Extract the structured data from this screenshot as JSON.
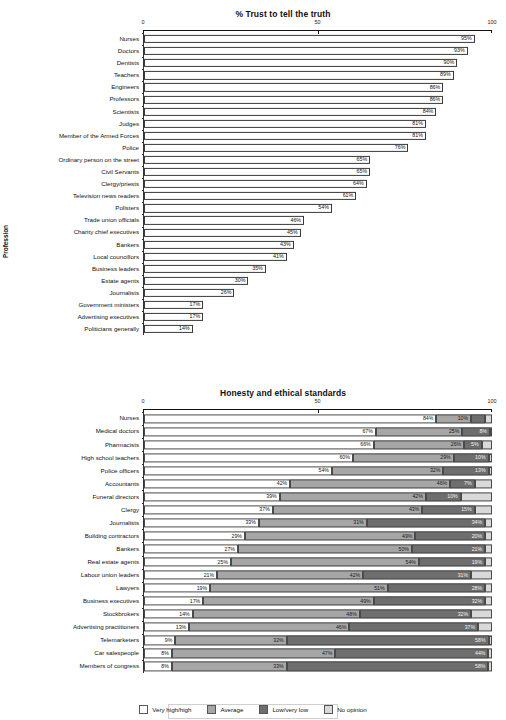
{
  "chart_data": [
    {
      "type": "bar",
      "title": "% Trust to tell the truth",
      "orientation": "horizontal",
      "xlabel": "",
      "ylabel": "Profession",
      "xlim": [
        0,
        100
      ],
      "xticks": [
        "0",
        "50",
        "100"
      ],
      "grid": false,
      "value_suffix": "%",
      "categories": [
        "Nurses",
        "Doctors",
        "Dentists",
        "Teachers",
        "Engineers",
        "Professors",
        "Scientists",
        "Judges",
        "Member of the Armed Forces",
        "Police",
        "Ordinary person on the street",
        "Civil Servants",
        "Clergy/priests",
        "Television news readers",
        "Pollsters",
        "Trade union officials",
        "Charity chief executives",
        "Bankers",
        "Local councillors",
        "Business leaders",
        "Estate agents",
        "Journalists",
        "Government ministers",
        "Advertising executives",
        "Politicians generally"
      ],
      "values": [
        95,
        93,
        90,
        89,
        86,
        86,
        84,
        81,
        81,
        76,
        65,
        65,
        64,
        61,
        54,
        46,
        45,
        43,
        41,
        35,
        30,
        26,
        17,
        17,
        14
      ],
      "labels": [
        "95%",
        "93%",
        "90%",
        "89%",
        "86%",
        "86%",
        "84%",
        "81%",
        "81%",
        "76%",
        "65%",
        "65%",
        "64%",
        "61%",
        "54%",
        "46%",
        "45%",
        "43%",
        "41%",
        "35%",
        "30%",
        "26%",
        "17%",
        "17%",
        "14%"
      ]
    },
    {
      "type": "bar",
      "subtype": "stacked-100",
      "title": "Honesty and ethical standards",
      "orientation": "horizontal",
      "xlabel": "",
      "ylabel": "Profession",
      "xlim": [
        0,
        100
      ],
      "xticks": [
        "0",
        "50",
        "100"
      ],
      "grid": false,
      "legend_position": "bottom",
      "series": [
        {
          "name": "Very high/high",
          "color": "#ffffff"
        },
        {
          "name": "Average",
          "color": "#a6a6a6"
        },
        {
          "name": "Low/very low",
          "color": "#6e6e6e"
        },
        {
          "name": "No opinion",
          "color": "#d9d9d9"
        }
      ],
      "categories": [
        "Nurses",
        "Medical doctors",
        "Pharmacists",
        "High school teachers",
        "Police officers",
        "Accountants",
        "Funeral directors",
        "Clergy",
        "Journalists",
        "Building contractors",
        "Bankers",
        "Real estate agents",
        "Labour union leaders",
        "Lawyers",
        "Business executives",
        "Stockbrokers",
        "Advertising practitioners",
        "Telemarketers",
        "Car salespeople",
        "Members of congress"
      ],
      "rows": [
        {
          "category": "Nurses",
          "values": [
            84,
            10,
            4,
            2
          ],
          "labels": [
            "84%",
            "10%",
            "",
            ""
          ]
        },
        {
          "category": "Medical doctors",
          "values": [
            67,
            25,
            8,
            0
          ],
          "labels": [
            "67%",
            "25%",
            "8%",
            ""
          ]
        },
        {
          "category": "Pharmacists",
          "values": [
            66,
            26,
            5,
            3
          ],
          "labels": [
            "66%",
            "26%",
            "5%",
            ""
          ]
        },
        {
          "category": "High school teachers",
          "values": [
            60,
            29,
            10,
            1
          ],
          "labels": [
            "60%",
            "29%",
            "10%",
            ""
          ]
        },
        {
          "category": "Police officers",
          "values": [
            54,
            32,
            13,
            1
          ],
          "labels": [
            "54%",
            "32%",
            "13%",
            ""
          ]
        },
        {
          "category": "Accountants",
          "values": [
            42,
            46,
            7,
            5
          ],
          "labels": [
            "42%",
            "46%",
            "7%",
            ""
          ]
        },
        {
          "category": "Funeral directors",
          "values": [
            39,
            42,
            10,
            9
          ],
          "labels": [
            "39%",
            "42%",
            "10%",
            ""
          ]
        },
        {
          "category": "Clergy",
          "values": [
            37,
            43,
            15,
            5
          ],
          "labels": [
            "37%",
            "43%",
            "15%",
            ""
          ]
        },
        {
          "category": "Journalists",
          "values": [
            33,
            31,
            34,
            2
          ],
          "labels": [
            "33%",
            "31%",
            "34%",
            ""
          ]
        },
        {
          "category": "Building contractors",
          "values": [
            29,
            49,
            20,
            2
          ],
          "labels": [
            "29%",
            "49%",
            "20%",
            ""
          ]
        },
        {
          "category": "Bankers",
          "values": [
            27,
            50,
            21,
            2
          ],
          "labels": [
            "27%",
            "50%",
            "21%",
            ""
          ]
        },
        {
          "category": "Real estate agents",
          "values": [
            25,
            54,
            19,
            2
          ],
          "labels": [
            "25%",
            "54%",
            "19%",
            ""
          ]
        },
        {
          "category": "Labour union leaders",
          "values": [
            21,
            42,
            31,
            6
          ],
          "labels": [
            "21%",
            "42%",
            "31%",
            ""
          ]
        },
        {
          "category": "Lawyers",
          "values": [
            19,
            51,
            28,
            2
          ],
          "labels": [
            "19%",
            "51%",
            "28%",
            ""
          ]
        },
        {
          "category": "Business executives",
          "values": [
            17,
            49,
            32,
            2
          ],
          "labels": [
            "17%",
            "49%",
            "32%",
            ""
          ]
        },
        {
          "category": "Stockbrokers",
          "values": [
            14,
            48,
            32,
            6
          ],
          "labels": [
            "14%",
            "48%",
            "32%",
            ""
          ]
        },
        {
          "category": "Advertising practitioners",
          "values": [
            13,
            46,
            37,
            4
          ],
          "labels": [
            "13%",
            "46%",
            "37%",
            ""
          ]
        },
        {
          "category": "Telemarketers",
          "values": [
            9,
            32,
            58,
            1
          ],
          "labels": [
            "9%",
            "32%",
            "58%",
            ""
          ]
        },
        {
          "category": "Car salespeople",
          "values": [
            8,
            47,
            44,
            1
          ],
          "labels": [
            "8%",
            "47%",
            "44%",
            ""
          ]
        },
        {
          "category": "Members of congress",
          "values": [
            8,
            33,
            58,
            1
          ],
          "labels": [
            "8%",
            "33%",
            "58%",
            ""
          ]
        }
      ]
    }
  ]
}
